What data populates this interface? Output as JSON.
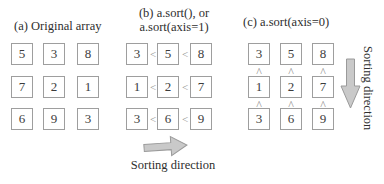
{
  "figure": {
    "panel_a": {
      "caption": "(a) Original array",
      "grid": [
        [
          "5",
          "3",
          "8"
        ],
        [
          "7",
          "2",
          "1"
        ],
        [
          "6",
          "9",
          "3"
        ]
      ]
    },
    "panel_b": {
      "caption_line1": "(b) a.sort(), or",
      "caption_line2": "a.sort(axis=1)",
      "grid": [
        [
          "3",
          "5",
          "8"
        ],
        [
          "1",
          "2",
          "7"
        ],
        [
          "3",
          "6",
          "9"
        ]
      ],
      "comparator": "<",
      "arrow_label": "Sorting direction"
    },
    "panel_c": {
      "caption": "(c) a.sort(axis=0)",
      "grid": [
        [
          "3",
          "5",
          "8"
        ],
        [
          "1",
          "2",
          "7"
        ],
        [
          "3",
          "6",
          "9"
        ]
      ],
      "comparator": "^",
      "arrow_label": "Sorting direction"
    }
  },
  "colors": {
    "background": "#ffffff",
    "box_border": "#9e9e9e",
    "number_text": "#3c3c3c",
    "caption_text": "#2e2e2e",
    "comparator_text": "#8f8f8f",
    "arrow_fill": "#c9c9c9",
    "arrow_stroke": "#9a9a9a"
  }
}
